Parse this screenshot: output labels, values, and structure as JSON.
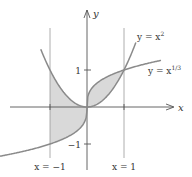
{
  "chart_data": {
    "type": "line",
    "title": "",
    "xlabel": "x",
    "ylabel": "y",
    "xlim": [
      -2.35,
      2.1
    ],
    "ylim": [
      -1.3,
      2.7
    ],
    "grid": false,
    "series": [
      {
        "name": "y = x^2",
        "label_text": "y = x",
        "label_sup": "2",
        "function": "x^2",
        "domain": [
          -1.25,
          1.32
        ]
      },
      {
        "name": "y = x^(1/3)",
        "label_text": "y = x",
        "label_sup": "1/3",
        "function": "cbrt(x)",
        "domain": [
          -2.35,
          2.0
        ]
      }
    ],
    "vertical_lines": [
      {
        "x": -1,
        "label": "x = −1"
      },
      {
        "x": 1,
        "label": "x = 1"
      }
    ],
    "y_ticks": [
      {
        "value": 1,
        "label": "1"
      },
      {
        "value": -1,
        "label": "−1"
      }
    ],
    "shaded_regions": [
      {
        "between": [
          "x^2",
          "cbrt(x)"
        ],
        "x_range": [
          -1,
          0
        ]
      },
      {
        "between": [
          "x^2",
          "cbrt(x)"
        ],
        "x_range": [
          0,
          1
        ]
      }
    ],
    "colors": {
      "curve": "#8a8a8a",
      "shade": "#d9d9d9",
      "axis": "#555555",
      "guide": "#9a9a9a"
    }
  }
}
